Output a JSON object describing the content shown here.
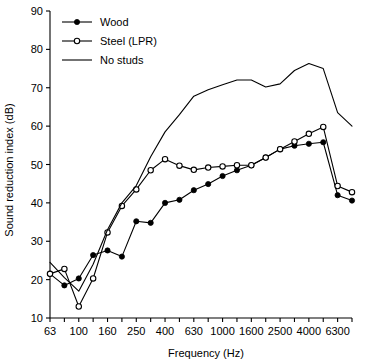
{
  "chart_data": {
    "type": "line",
    "title": "",
    "xlabel": "Frequency (Hz)",
    "ylabel": "Sound reduction index (dB)",
    "ylim": [
      10,
      90
    ],
    "ytick_step": 10,
    "yticks": [
      10,
      20,
      30,
      40,
      50,
      60,
      70,
      80,
      90
    ],
    "grid": false,
    "legend_position": "top-left",
    "x_scale": "log-third-octave-bands",
    "x": [
      63,
      80,
      100,
      125,
      160,
      200,
      250,
      315,
      400,
      500,
      630,
      800,
      1000,
      1250,
      1600,
      2000,
      2500,
      3150,
      4000,
      5000,
      6300,
      8000
    ],
    "xtick_labels": [
      "63",
      "",
      "100",
      "",
      "160",
      "",
      "250",
      "",
      "400",
      "",
      "630",
      "",
      "1000",
      "",
      "1600",
      "",
      "2500",
      "",
      "4000",
      "",
      "6300",
      ""
    ],
    "xtick_labels_shown": [
      "63",
      "100",
      "160",
      "250",
      "400",
      "630",
      "1000",
      "1600",
      "2500",
      "4000",
      "6300"
    ],
    "series": [
      {
        "name": "Wood",
        "marker": "filled-circle",
        "color": "#000000",
        "values": [
          21.5,
          18.5,
          20.3,
          26.4,
          27.6,
          26.0,
          35.2,
          34.8,
          40.0,
          40.8,
          43.3,
          44.9,
          47.0,
          48.5,
          49.8,
          51.8,
          54.0,
          54.9,
          55.4,
          55.8,
          42.0,
          40.6
        ]
      },
      {
        "name": "Steel (LPR)",
        "marker": "open-circle",
        "color": "#000000",
        "values": [
          21.5,
          22.8,
          13.0,
          20.3,
          32.3,
          39.2,
          43.5,
          48.5,
          51.4,
          49.7,
          48.6,
          49.2,
          49.5,
          49.8,
          49.8,
          51.8,
          54.0,
          56.0,
          58.0,
          59.8,
          44.4,
          42.8
        ]
      },
      {
        "name": "No studs",
        "marker": "none",
        "color": "#000000",
        "values": [
          24.5,
          20.5,
          17.0,
          24.0,
          33.0,
          40.0,
          44.5,
          52.0,
          58.5,
          63.0,
          67.8,
          69.5,
          70.8,
          72.0,
          72.0,
          70.2,
          71.0,
          74.5,
          76.3,
          75.0,
          63.5,
          60.0
        ]
      }
    ]
  },
  "legend": {
    "items": [
      {
        "label": "Wood",
        "marker": "filled-circle"
      },
      {
        "label": "Steel (LPR)",
        "marker": "open-circle"
      },
      {
        "label": "No studs",
        "marker": "none"
      }
    ]
  },
  "axes": {
    "x_title": "Frequency (Hz)",
    "y_title": "Sound reduction index (dB)"
  }
}
